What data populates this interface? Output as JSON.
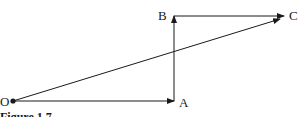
{
  "diagram": {
    "type": "vector-addition",
    "points": {
      "O": {
        "label": "O",
        "x": 13,
        "y": 101
      },
      "A": {
        "label": "A",
        "x": 174,
        "y": 101
      },
      "B": {
        "label": "B",
        "x": 174,
        "y": 16
      },
      "C": {
        "label": "C",
        "x": 283,
        "y": 16
      }
    },
    "vectors": [
      {
        "from": "O",
        "to": "A"
      },
      {
        "from": "A",
        "to": "B"
      },
      {
        "from": "B",
        "to": "C"
      },
      {
        "from": "O",
        "to": "C"
      }
    ],
    "caption": "Figure 1.7",
    "line_color": "#1a1a1a"
  }
}
